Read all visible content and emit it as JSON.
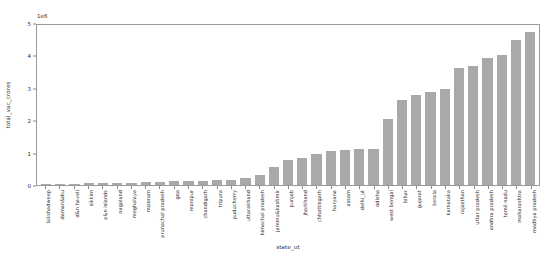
{
  "chart_data": {
    "type": "bar",
    "title": "",
    "xlabel": "state_ut",
    "ylabel": "total_vac_crores",
    "offset_text": "1e6",
    "ylim": [
      0,
      5
    ],
    "yticks": [
      0,
      1,
      2,
      3,
      4,
      5
    ],
    "ytick_labels": [
      "0",
      "1",
      "2",
      "3",
      "4",
      "5"
    ],
    "grid": false,
    "legend": null,
    "bar_color": "#a9a9a9",
    "categories": [
      "lakshadweep",
      "daman&diu",
      "d&n haveli",
      "sikkim",
      "a&n islands",
      "nagaland",
      "meghalaya",
      "mizoram",
      "arunachal pradesh",
      "goa",
      "manipur",
      "chandigarh",
      "tripura",
      "puducherry",
      "uttarakhand",
      "himachal pradesh",
      "jammu&kashmir",
      "punjab",
      "jharkhand",
      "chhattisgarh",
      "haryana",
      "assam",
      "delhi_ut",
      "odisha",
      "west bengal",
      "bihar",
      "gujarat",
      "kerala",
      "karnataka",
      "rajasthan",
      "uttar pradesh",
      "andhra pradesh",
      "tamil nadu",
      "maharashtra",
      "madhya pradesh"
    ],
    "values": [
      0.02,
      0.03,
      0.04,
      0.05,
      0.05,
      0.06,
      0.07,
      0.08,
      0.09,
      0.11,
      0.12,
      0.13,
      0.14,
      0.15,
      0.22,
      0.3,
      0.55,
      0.78,
      0.82,
      0.95,
      1.05,
      1.08,
      1.1,
      1.12,
      2.05,
      2.62,
      2.78,
      2.88,
      2.95,
      3.6,
      3.68,
      3.92,
      4.02,
      4.48,
      4.72
    ]
  }
}
